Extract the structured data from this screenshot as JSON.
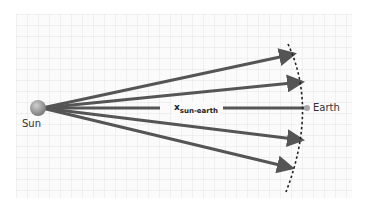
{
  "diagram": {
    "sun_label": "Sun",
    "earth_label": "Earth",
    "distance_label_main": "x",
    "distance_label_sub": "sun-earth",
    "colors": {
      "grid": "#e2e2e2",
      "grid_bg": "#fbfbfb",
      "arrow": "#555555",
      "sun": "#9a9a9a",
      "earth": "#a8a8a8",
      "arc": "#222222"
    }
  }
}
